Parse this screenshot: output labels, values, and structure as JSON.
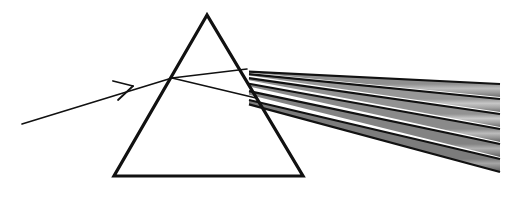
{
  "figure": {
    "name": "prism-dispersion",
    "title": "White light dispersion through a triangular prism",
    "width": 514,
    "height": 207,
    "background_color": "#ffffff",
    "stroke_color": "#111111"
  },
  "prism": {
    "label": "triangular-prism",
    "apex": [
      207,
      15
    ],
    "base_left": [
      114,
      176
    ],
    "base_right": [
      303,
      176
    ],
    "stroke_color": "#111111",
    "stroke_width": 3.2,
    "fill": "none"
  },
  "incident_ray": {
    "label": "incident-white-light-ray",
    "start": [
      22,
      124
    ],
    "end": [
      172,
      78
    ],
    "stroke_color": "#111111",
    "stroke_width": 1.6,
    "arrow": {
      "label": "direction-arrowhead",
      "apex": [
        133,
        86
      ],
      "wing_upper": [
        113,
        81
      ],
      "wing_lower": [
        118,
        100
      ],
      "stroke_width": 1.8
    }
  },
  "internal_rays": [
    {
      "label": "internal-ray-upper",
      "start": [
        172,
        78
      ],
      "end": [
        247,
        69
      ],
      "stroke_color": "#111111",
      "stroke_width": 1.6
    },
    {
      "label": "internal-ray-lower",
      "start": [
        172,
        78
      ],
      "end": [
        256,
        98
      ],
      "stroke_color": "#111111",
      "stroke_width": 1.6
    }
  ],
  "exit_point": [
    249,
    71
  ],
  "spectrum": {
    "label": "dispersed-spectrum-fan",
    "origin": [
      249,
      71
    ],
    "right_edge_x": 500,
    "band_count": 6,
    "band_separator_color": "#111111",
    "band_separator_width": 2.2,
    "bands": [
      {
        "name": "band-1",
        "order": 1,
        "right_top_y": 84,
        "right_bottom_y": 97,
        "gradient": [
          "#8f8f8f",
          "#bdbdbd",
          "#9a9a9a",
          "#6e6e6e"
        ]
      },
      {
        "name": "band-2",
        "order": 2,
        "right_top_y": 99,
        "right_bottom_y": 112,
        "gradient": [
          "#979797",
          "#c6c6c6",
          "#a3a3a3",
          "#6f6f6f"
        ]
      },
      {
        "name": "band-3",
        "order": 3,
        "right_top_y": 114,
        "right_bottom_y": 127,
        "gradient": [
          "#929292",
          "#c9c9c9",
          "#a0a0a0",
          "#6b6b6b"
        ]
      },
      {
        "name": "band-4",
        "order": 4,
        "right_top_y": 129,
        "right_bottom_y": 142,
        "gradient": [
          "#8a8a8a",
          "#bcbcbc",
          "#949494",
          "#636363"
        ]
      },
      {
        "name": "band-5",
        "order": 5,
        "right_top_y": 144,
        "right_bottom_y": 157,
        "gradient": [
          "#838383",
          "#b0b0b0",
          "#8b8b8b",
          "#5c5c5c"
        ]
      },
      {
        "name": "band-6",
        "order": 6,
        "right_top_y": 159,
        "right_bottom_y": 172,
        "gradient": [
          "#7c7c7c",
          "#a6a6a6",
          "#818181",
          "#555555"
        ]
      }
    ]
  }
}
